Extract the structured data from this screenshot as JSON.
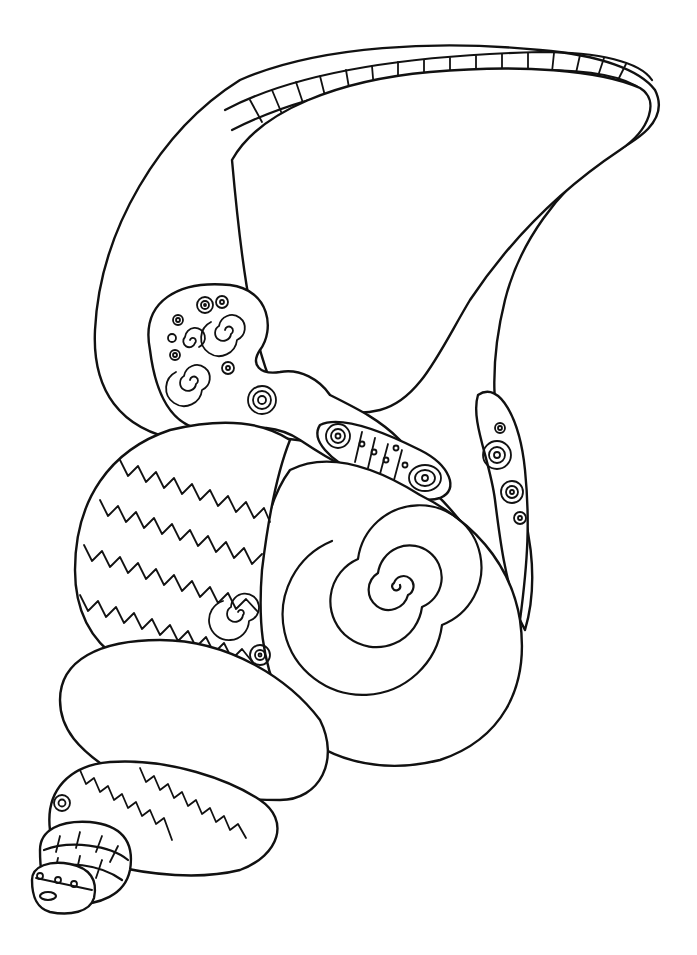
{
  "illustration": {
    "subject": "seashell coloring page",
    "line_color": "#111111",
    "background_color": "#ffffff",
    "regions": [
      {
        "name": "outer-lip",
        "pattern": "blob-maze"
      },
      {
        "name": "aperture",
        "pattern": "y-tessellation"
      },
      {
        "name": "lip-rim",
        "pattern": "scalloped-band"
      },
      {
        "name": "spiral-cluster",
        "pattern": "spirals-and-rings"
      },
      {
        "name": "siphonal-band",
        "pattern": "dotted-cells"
      },
      {
        "name": "body-whorl-left",
        "pattern": "zigzag-bands"
      },
      {
        "name": "body-whorl-spiral",
        "pattern": "large-spiral"
      },
      {
        "name": "second-whorl",
        "pattern": "blob-maze"
      },
      {
        "name": "third-whorl",
        "pattern": "zigzag-bands"
      },
      {
        "name": "apex",
        "pattern": "brick-rings"
      }
    ]
  }
}
